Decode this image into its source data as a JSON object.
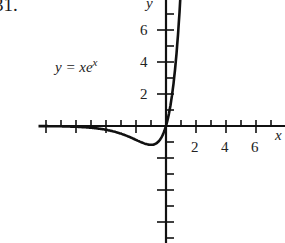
{
  "problem_number": "31.",
  "chart_data": {
    "type": "line",
    "title": "",
    "function": "y = xe^x",
    "annotation": "y = xe^x",
    "xlabel": "x",
    "ylabel": "y",
    "x_ticks_labeled": [
      2,
      4,
      6
    ],
    "y_ticks_labeled": [
      2,
      4,
      6
    ],
    "xlim": [
      -8,
      7.5
    ],
    "ylim": [
      -8,
      8
    ],
    "grid": false,
    "series": [
      {
        "name": "y = xe^x",
        "x": [
          -8,
          -6,
          -5,
          -4,
          -3,
          -2,
          -1.5,
          -1,
          -0.5,
          0,
          0.5,
          1,
          1.25,
          1.5,
          1.7
        ],
        "values": [
          -0.003,
          -0.015,
          -0.034,
          -0.073,
          -0.149,
          -0.271,
          -0.335,
          -0.368,
          -0.303,
          0,
          0.824,
          2.718,
          4.363,
          6.723,
          9.3
        ]
      }
    ]
  },
  "labels": {
    "x_axis": "x",
    "y_axis": "y",
    "equation_prefix": "y = xe",
    "equation_sup": "x",
    "tick2": "2",
    "tick4": "4",
    "tick6": "6",
    "ytick2": "2",
    "ytick4": "4",
    "ytick6": "6"
  }
}
